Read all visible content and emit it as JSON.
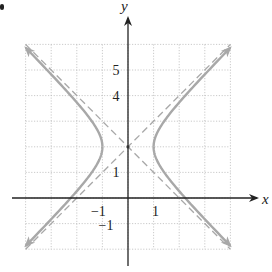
{
  "figure": {
    "corner_mark": "•"
  },
  "chart_data": {
    "type": "line",
    "title": "",
    "xlabel": "x",
    "ylabel": "y",
    "xlim": [
      -4,
      4
    ],
    "ylim": [
      -2,
      6
    ],
    "grid": true,
    "grid_style": "dotted",
    "legend": null,
    "equation": "x^2 - (y-2)^2 = 1",
    "center": [
      0,
      2
    ],
    "vertices": [
      [
        -1,
        2
      ],
      [
        1,
        2
      ]
    ],
    "x_intercepts": [
      -2.236,
      2.236
    ],
    "tick_labels": {
      "x": [
        {
          "value": -1,
          "label": "−1"
        },
        {
          "value": 1,
          "label": "1"
        }
      ],
      "y": [
        {
          "value": 5,
          "label": "5"
        },
        {
          "value": 4,
          "label": "4"
        },
        {
          "value": 1,
          "label": "1"
        },
        {
          "value": -1,
          "label": "−1"
        }
      ]
    },
    "series": [
      {
        "name": "hyperbola-right-branch",
        "style": "solid",
        "color": "#a8a8a8",
        "x": [
          4.0,
          3.0,
          2.0,
          1.5,
          1.2,
          1.0,
          1.2,
          1.5,
          2.0,
          3.0,
          4.0
        ],
        "y": [
          5.87,
          4.83,
          3.73,
          3.12,
          2.66,
          2.0,
          1.34,
          0.88,
          0.27,
          -0.83,
          -1.87
        ]
      },
      {
        "name": "hyperbola-left-branch",
        "style": "solid",
        "color": "#a8a8a8",
        "x": [
          -4.0,
          -3.0,
          -2.0,
          -1.5,
          -1.2,
          -1.0,
          -1.2,
          -1.5,
          -2.0,
          -3.0,
          -4.0
        ],
        "y": [
          5.87,
          4.83,
          3.73,
          3.12,
          2.66,
          2.0,
          1.34,
          0.88,
          0.27,
          -0.83,
          -1.87
        ]
      },
      {
        "name": "asymptote-1",
        "style": "dashed",
        "color": "#a8a8a8",
        "equation": "y = x + 2",
        "x": [
          -4,
          4
        ],
        "y": [
          -2,
          6
        ]
      },
      {
        "name": "asymptote-2",
        "style": "dashed",
        "color": "#a8a8a8",
        "equation": "y = -x + 2",
        "x": [
          -4,
          4
        ],
        "y": [
          6,
          -2
        ]
      }
    ],
    "colors": {
      "axis": "#222222",
      "grid": "#bdbdbd",
      "curve": "#a8a8a8",
      "asymptote": "#a8a8a8"
    }
  }
}
